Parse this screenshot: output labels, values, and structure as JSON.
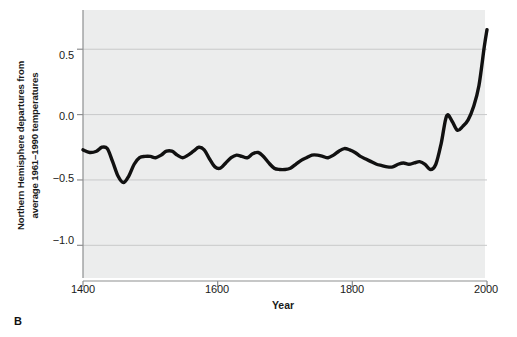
{
  "panel": {
    "label": "B"
  },
  "chart_data": {
    "type": "line",
    "title": "",
    "subtitle": "",
    "xlabel": "Year",
    "ylabel": "Northern Hemisphere departures from average 1961–1990 temperatures",
    "ylabel_line1": "Northern Hemisphere departures from",
    "ylabel_line2": "average 1961–1990 temperatures",
    "xlim": [
      1400,
      2000
    ],
    "ylim": [
      -1.25,
      0.8
    ],
    "xticks": [
      1400,
      1600,
      1800,
      2000
    ],
    "xtick_labels": [
      "1400",
      "1600",
      "1800",
      "2000"
    ],
    "yticks": [
      0.5,
      0.0,
      -0.5,
      -1.0
    ],
    "ytick_labels": [
      "0.5",
      "0.0",
      "−0.5",
      "−1.0"
    ],
    "grid": "horizontal",
    "legend": "none",
    "line_color": "#111111",
    "line_width": 3.4,
    "plot_background": "#eceded",
    "gridline_color": "#c8c9ca",
    "series": [
      {
        "name": "Northern Hemisphere temperature anomaly",
        "x": [
          1400,
          1410,
          1420,
          1428,
          1436,
          1444,
          1452,
          1460,
          1468,
          1476,
          1484,
          1492,
          1500,
          1508,
          1516,
          1524,
          1532,
          1540,
          1548,
          1556,
          1564,
          1572,
          1580,
          1588,
          1596,
          1604,
          1612,
          1620,
          1628,
          1636,
          1644,
          1652,
          1660,
          1668,
          1676,
          1684,
          1692,
          1700,
          1708,
          1716,
          1724,
          1732,
          1740,
          1748,
          1756,
          1764,
          1772,
          1780,
          1788,
          1796,
          1804,
          1812,
          1820,
          1828,
          1836,
          1844,
          1852,
          1860,
          1868,
          1876,
          1884,
          1892,
          1900,
          1908,
          1916,
          1924,
          1932,
          1940,
          1948,
          1956,
          1964,
          1972,
          1980,
          1988,
          1996,
          2000
        ],
        "y": [
          -0.27,
          -0.29,
          -0.28,
          -0.25,
          -0.26,
          -0.36,
          -0.47,
          -0.52,
          -0.47,
          -0.38,
          -0.33,
          -0.32,
          -0.32,
          -0.33,
          -0.31,
          -0.28,
          -0.28,
          -0.31,
          -0.33,
          -0.31,
          -0.28,
          -0.25,
          -0.27,
          -0.34,
          -0.4,
          -0.41,
          -0.37,
          -0.33,
          -0.31,
          -0.32,
          -0.33,
          -0.3,
          -0.29,
          -0.32,
          -0.37,
          -0.41,
          -0.42,
          -0.42,
          -0.41,
          -0.38,
          -0.35,
          -0.33,
          -0.31,
          -0.31,
          -0.32,
          -0.33,
          -0.31,
          -0.28,
          -0.26,
          -0.27,
          -0.29,
          -0.32,
          -0.34,
          -0.36,
          -0.38,
          -0.39,
          -0.4,
          -0.4,
          -0.38,
          -0.37,
          -0.38,
          -0.37,
          -0.36,
          -0.38,
          -0.42,
          -0.38,
          -0.22,
          -0.01,
          -0.05,
          -0.12,
          -0.09,
          -0.04,
          0.06,
          0.22,
          0.52,
          0.65
        ],
        "units": "°C anomaly"
      }
    ],
    "annotations": []
  }
}
